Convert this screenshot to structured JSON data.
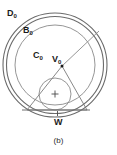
{
  "figure": {
    "caption": "(b)",
    "background_color": "#ffffff",
    "stroke_color": "#555555",
    "text_color": "#1a1a1a",
    "labels": {
      "outer_disk": {
        "base": "D",
        "sub": "0",
        "full": "D0"
      },
      "ball": {
        "base": "B",
        "sub": "0",
        "full": "B0"
      },
      "circle": {
        "base": "C",
        "sub": "0",
        "full": "C0"
      },
      "vertex": {
        "base": "V",
        "sub": "0",
        "full": "V0"
      },
      "wedge": {
        "base": "W",
        "sub": "",
        "full": "W"
      }
    }
  },
  "geometry": {
    "center": {
      "x": 55,
      "y": 65
    },
    "circles": [
      {
        "name": "D0",
        "cx": 55,
        "cy": 65,
        "r": 52
      },
      {
        "name": "B0",
        "cx": 55,
        "cy": 65,
        "r": 49
      },
      {
        "name": "C0",
        "cx": 55,
        "cy": 65,
        "r": 40
      },
      {
        "name": "inscribed",
        "cx": 55,
        "cy": 94,
        "r": 16
      }
    ],
    "vertex_point": {
      "x": 62,
      "y": 66
    },
    "triangle": [
      {
        "x": 62,
        "y": 66
      },
      {
        "x": 27,
        "y": 110
      },
      {
        "x": 87,
        "y": 110
      }
    ],
    "radius_line": {
      "x1": 62,
      "y1": 66,
      "x2": 98,
      "y2": 32
    },
    "chord_W": {
      "x1": 24,
      "y1": 110,
      "x2": 88,
      "y2": 110
    },
    "center_cross": {
      "x": 55,
      "y": 94,
      "size": 4
    },
    "w_tick": {
      "x1": 57,
      "y1": 112,
      "x2": 57,
      "y2": 116
    }
  }
}
